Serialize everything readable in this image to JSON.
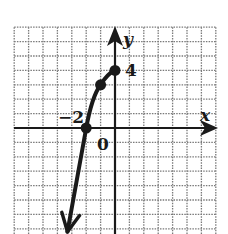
{
  "chart_data": {
    "type": "line",
    "title": "",
    "xlabel": "x",
    "ylabel": "y",
    "xlim": [
      -7,
      7
    ],
    "ylim": [
      -7,
      7
    ],
    "grid": true,
    "grid_style": "dotted",
    "tick_labels": [
      {
        "text": "-2",
        "at": "x=-2",
        "position": "above-left"
      },
      {
        "text": "0",
        "at": "origin",
        "position": "below-right"
      },
      {
        "text": "4",
        "at": "y=4",
        "position": "right"
      }
    ],
    "series": [
      {
        "name": "curve",
        "x": [
          -3.3,
          -2,
          -1,
          0
        ],
        "y": [
          -7.2,
          0,
          3,
          4
        ],
        "endpoint_left": "arrow",
        "endpoint_right": "closed-dot"
      }
    ],
    "marked_points": [
      {
        "x": -2,
        "y": 0
      },
      {
        "x": -1,
        "y": 3
      },
      {
        "x": 0,
        "y": 4
      }
    ]
  },
  "labels": {
    "x_axis": "x",
    "y_axis": "y",
    "tick_neg2": "−2",
    "tick_zero": "0",
    "tick_four": "4"
  },
  "colors": {
    "ink": "#1a1a1a",
    "grid": "#7a7a7a",
    "background": "#ffffff"
  }
}
